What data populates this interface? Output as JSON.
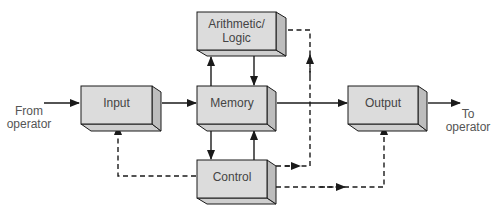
{
  "diagram": {
    "type": "block-diagram",
    "colors": {
      "box_front": "#dcdcdc",
      "box_side": "#bdbdbd",
      "box_bottom": "#cfcfcf",
      "stroke": "#1a1a1a",
      "text": "#444444"
    },
    "blocks": {
      "arithmetic_logic": {
        "line1": "Arithmetic/",
        "line2": "Logic"
      },
      "input": {
        "label": "Input"
      },
      "memory": {
        "label": "Memory"
      },
      "output": {
        "label": "Output"
      },
      "control": {
        "label": "Control"
      }
    },
    "external": {
      "from_operator": {
        "line1": "From",
        "line2": "operator"
      },
      "to_operator": {
        "line1": "To",
        "line2": "operator"
      }
    },
    "connections": {
      "data_flow_solid": [
        "From operator -> Input",
        "Input -> Memory",
        "Memory -> Output",
        "Output -> To operator",
        "Memory -> Arithmetic/Logic",
        "Arithmetic/Logic -> Memory",
        "Memory -> Control",
        "Control -> Memory"
      ],
      "control_flow_dashed": [
        "Control -> Input",
        "Control -> Arithmetic/Logic",
        "Control -> Output"
      ]
    }
  }
}
